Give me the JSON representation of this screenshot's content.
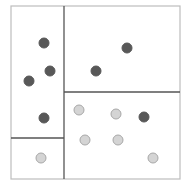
{
  "diagram": {
    "type": "kd-tree-partition",
    "outer_box": {
      "x1": 11,
      "y1": 6,
      "x2": 180,
      "y2": 179,
      "color": "#bdbdbd"
    },
    "split_lines": [
      {
        "id": "vertical-split",
        "x1": 64,
        "y1": 6,
        "x2": 64,
        "y2": 179,
        "color": "#555555"
      },
      {
        "id": "horizontal-split-right",
        "x1": 64,
        "y1": 92,
        "x2": 180,
        "y2": 92,
        "color": "#555555"
      },
      {
        "id": "horizontal-split-left",
        "x1": 11,
        "y1": 138,
        "x2": 64,
        "y2": 138,
        "color": "#555555"
      }
    ],
    "point_styles": {
      "dark": {
        "fill": "#585858",
        "stroke": "#585858"
      },
      "light": {
        "fill": "#d4d4d4",
        "stroke": "#a8a8a8"
      }
    },
    "point_radius": 5,
    "points": [
      {
        "x": 44,
        "y": 43,
        "class": "dark"
      },
      {
        "x": 50,
        "y": 71,
        "class": "dark"
      },
      {
        "x": 29,
        "y": 81,
        "class": "dark"
      },
      {
        "x": 44,
        "y": 118,
        "class": "dark"
      },
      {
        "x": 41,
        "y": 158,
        "class": "light"
      },
      {
        "x": 127,
        "y": 48,
        "class": "dark"
      },
      {
        "x": 96,
        "y": 71,
        "class": "dark"
      },
      {
        "x": 79,
        "y": 110,
        "class": "light"
      },
      {
        "x": 116,
        "y": 114,
        "class": "light"
      },
      {
        "x": 144,
        "y": 117,
        "class": "dark"
      },
      {
        "x": 85,
        "y": 140,
        "class": "light"
      },
      {
        "x": 118,
        "y": 140,
        "class": "light"
      },
      {
        "x": 153,
        "y": 158,
        "class": "light"
      }
    ]
  }
}
